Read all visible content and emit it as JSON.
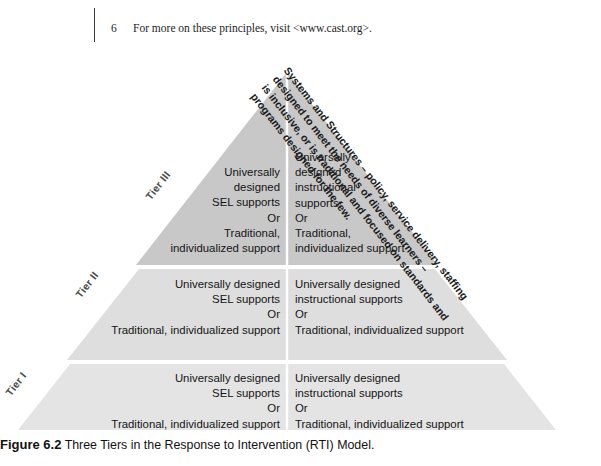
{
  "footnote": {
    "number": "6",
    "text": "For more on these principles, visit <www.cast.org>."
  },
  "figure": {
    "caption_label": "Figure 6.2",
    "caption_text": "Three Tiers in the Response to Intervention (RTI) Model.",
    "systems_and_structures": "Systems and Structures – policy, service delivery, staffing designed to meet the needs of diverse learners –\nis inclusive, or is traditional and focused on standards and programs designed for the few."
  },
  "colors": {
    "tier3_fill": "#c8c8c8",
    "tier2_fill": "#dedede",
    "tier1_fill": "#e4e4e4",
    "divider": "#ffffff",
    "text": "#141414",
    "label": "#4a4a4a"
  },
  "tiers": [
    {
      "id": "tier-3",
      "label": "Tier III",
      "left_column": "Universally\ndesigned\nSEL supports\nOr\nTraditional,\nindividualized support",
      "right_column": "Universally\ndesigned\ninstructional\nsupports\nOr\nTraditional,\nindividualized support"
    },
    {
      "id": "tier-2",
      "label": "Tier II",
      "left_column": "Universally designed\nSEL supports\nOr\nTraditional, individualized support",
      "right_column": "Universally designed\ninstructional supports\nOr\nTraditional, individualized support"
    },
    {
      "id": "tier-1",
      "label": "Tier I",
      "left_column": "Universally designed\nSEL supports\nOr\nTraditional, individualized support",
      "right_column": "Universally designed\ninstructional supports\nOr\nTraditional, individualized support"
    }
  ]
}
